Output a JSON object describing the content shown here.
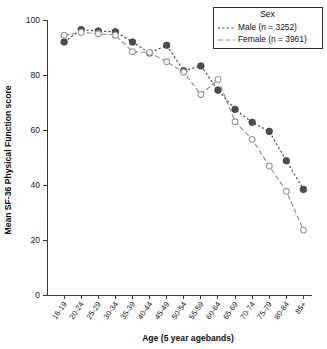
{
  "chart_data": {
    "type": "line",
    "title": "",
    "xlabel": "Age (5 year agebands)",
    "ylabel": "Mean SF-36 Physical Function score",
    "categories": [
      "16-19",
      "20-24",
      "25-29",
      "30-34",
      "35-39",
      "40-44",
      "45-49",
      "50-54",
      "55-59",
      "60-64",
      "65-69",
      "70-74",
      "75-79",
      "80-84",
      "85+"
    ],
    "yticks": [
      0,
      20,
      40,
      60,
      80,
      100
    ],
    "ylim": [
      0,
      100
    ],
    "grid": false,
    "legend_position": "top-right",
    "legend_title": "Sex",
    "series": [
      {
        "name": "Male (n = 3252)",
        "marker": "filled-circle",
        "linestyle": "dotted",
        "color": "#4d4d4d",
        "n": 3252,
        "values": [
          92.0,
          96.5,
          96.0,
          95.7,
          92.0,
          88.0,
          90.8,
          81.5,
          83.3,
          74.5,
          67.5,
          62.8,
          59.5,
          48.8,
          38.4
        ]
      },
      {
        "name": "Female (n = 3961)",
        "marker": "open-circle",
        "linestyle": "dash-dot",
        "color": "#9a9a9a",
        "n": 3961,
        "values": [
          94.5,
          95.5,
          95.0,
          94.5,
          88.5,
          88.2,
          84.8,
          81.0,
          72.9,
          78.4,
          63.0,
          56.6,
          46.9,
          37.7,
          23.6
        ]
      }
    ]
  },
  "axes": {
    "x_title": "Age (5 year agebands)",
    "y_title": "Mean SF-36 Physical Function score"
  },
  "legend": {
    "title": "Sex",
    "entries": [
      {
        "label": "Male (n = 3252)"
      },
      {
        "label": "Female (n = 3961)"
      }
    ]
  }
}
